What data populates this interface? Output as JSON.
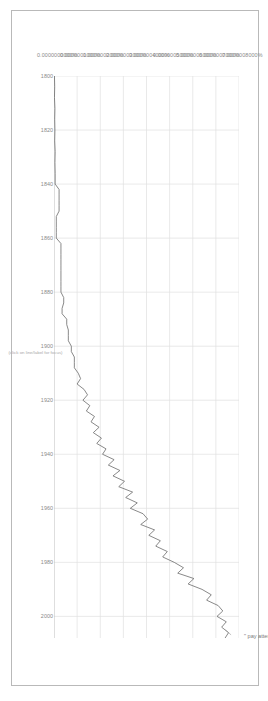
{
  "chart_data": {
    "type": "line",
    "title": "",
    "subtitle": "",
    "xlabel": "",
    "ylabel": "",
    "xaxis_note": "(click on line/label for focus)",
    "grid": true,
    "legend_position": "inline-annotation",
    "xlim": [
      1800,
      2008
    ],
    "ylim": [
      0.0,
      8e-07
    ],
    "xticks": [
      "1800",
      "1820",
      "1840",
      "1860",
      "1880",
      "1900",
      "1920",
      "1940",
      "1960",
      "1980",
      "2000"
    ],
    "ytick_labels": [
      "0.0000000000%",
      "0.0000001000%",
      "0.0000002000%",
      "0.0000003000%",
      "0.0000004000%",
      "0.0000005000%",
      "0.0000006000%",
      "0.0000007000%",
      "0.0000008000%"
    ],
    "ytick_values": [
      0,
      1e-09,
      2e-09,
      3e-09,
      4e-09,
      5e-09,
      6e-09,
      7e-09,
      8e-09
    ],
    "series": [
      {
        "name": "\" pay attention \"",
        "color": "#6b6b6b",
        "x": [
          1800,
          1804,
          1808,
          1812,
          1816,
          1820,
          1824,
          1828,
          1832,
          1836,
          1840,
          1842,
          1844,
          1846,
          1848,
          1850,
          1852,
          1854,
          1856,
          1858,
          1860,
          1862,
          1864,
          1866,
          1868,
          1870,
          1872,
          1874,
          1876,
          1878,
          1880,
          1882,
          1884,
          1886,
          1888,
          1890,
          1892,
          1894,
          1896,
          1898,
          1900,
          1902,
          1904,
          1906,
          1908,
          1910,
          1912,
          1914,
          1916,
          1918,
          1920,
          1922,
          1924,
          1926,
          1928,
          1930,
          1932,
          1934,
          1936,
          1938,
          1940,
          1942,
          1944,
          1946,
          1948,
          1950,
          1952,
          1954,
          1956,
          1958,
          1960,
          1962,
          1964,
          1966,
          1968,
          1970,
          1972,
          1974,
          1976,
          1978,
          1980,
          1982,
          1984,
          1986,
          1988,
          1990,
          1992,
          1994,
          1996,
          1998,
          2000,
          2002,
          2004,
          2006,
          2008
        ],
        "y": [
          0.02,
          0.03,
          0.02,
          0.04,
          0.03,
          0.04,
          0.03,
          0.05,
          0.04,
          0.05,
          0.05,
          0.22,
          0.22,
          0.22,
          0.22,
          0.22,
          0.1,
          0.1,
          0.1,
          0.1,
          0.1,
          0.3,
          0.3,
          0.3,
          0.3,
          0.3,
          0.3,
          0.3,
          0.3,
          0.3,
          0.3,
          0.42,
          0.42,
          0.35,
          0.35,
          0.55,
          0.55,
          0.62,
          0.62,
          0.62,
          0.75,
          0.75,
          0.88,
          0.88,
          0.88,
          1.05,
          1.15,
          1.0,
          1.3,
          1.45,
          1.25,
          1.55,
          1.4,
          1.75,
          1.6,
          1.95,
          1.7,
          2.05,
          1.85,
          2.25,
          2.1,
          2.6,
          2.35,
          2.85,
          2.55,
          3.05,
          2.8,
          3.4,
          3.1,
          3.6,
          3.3,
          3.85,
          4.05,
          3.75,
          4.35,
          4.1,
          4.6,
          4.4,
          4.9,
          4.7,
          5.2,
          5.6,
          5.35,
          6.05,
          5.8,
          6.4,
          6.8,
          6.6,
          7.1,
          7.3,
          7.05,
          7.45,
          7.25,
          7.55,
          7.4
        ],
        "y_scale_note": "values expressed in units of 1e-10 percent"
      }
    ],
    "annotation": {
      "text": "\" pay attention \"",
      "x": 2005,
      "y": 7.4
    }
  }
}
